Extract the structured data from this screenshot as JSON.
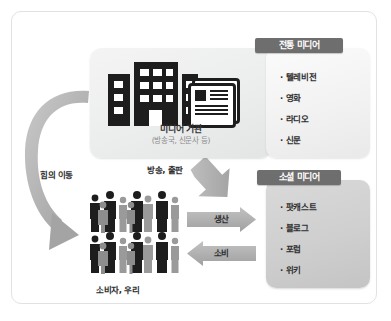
{
  "diagram": {
    "title_visible": false,
    "media_box": {
      "caption": "미디어 기관",
      "subcaption": "(방송국, 신문사 등)",
      "icons": [
        "buildings-icon",
        "newspaper-icon"
      ]
    },
    "panels": [
      {
        "id": "traditional-media",
        "title": "전통 미디어",
        "items": [
          "텔레비전",
          "영화",
          "라디오",
          "신문"
        ],
        "bullet": "·"
      },
      {
        "id": "social-media",
        "title": "소셜 미디어",
        "items": [
          "팟캐스트",
          "블로그",
          "포럼",
          "위키"
        ],
        "bullet": "·"
      }
    ],
    "arrows": [
      {
        "id": "power-shift-arrow",
        "label": "힘의 이동",
        "direction": "curved-left-down"
      },
      {
        "id": "broadcast-publish-arrow",
        "label": "방송, 출판",
        "direction": "diagonal-down-right"
      },
      {
        "id": "production-arrow",
        "label": "생산",
        "direction": "right"
      },
      {
        "id": "consumption-arrow",
        "label": "소비",
        "direction": "left"
      }
    ],
    "people_group": {
      "label": "소비자, 우리",
      "rows": 2,
      "figures_per_row": 9
    },
    "colors": {
      "header_bar": "#6e6e6e",
      "arrow_gray": "#a9a9a9",
      "dark_figure": "#1d1d1d",
      "light_figure": "#9a9a9a",
      "frame_border": "#e2e2e2",
      "social_panel_bg": "#cfcfcf"
    }
  }
}
